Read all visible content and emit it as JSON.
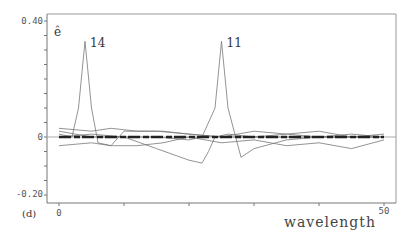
{
  "chart_data": {
    "type": "line",
    "panel_label": "(d)",
    "title": "",
    "xlabel": "wavelength",
    "ylabel": "ê",
    "xlim": [
      0,
      50
    ],
    "ylim": [
      -0.2,
      0.4
    ],
    "x_ticks": [
      "0",
      "50"
    ],
    "y_ticks": [
      "0.40",
      "0",
      "-0.20"
    ],
    "annotations": [
      {
        "text": "14",
        "x": 4,
        "y": 0.33
      },
      {
        "text": "11",
        "x": 25,
        "y": 0.33
      }
    ],
    "grid": false,
    "legend": "none",
    "series": [
      {
        "name": "14",
        "x": [
          0,
          2,
          3,
          4,
          5,
          6,
          8,
          10,
          15,
          20,
          25,
          30,
          35,
          40,
          45,
          50
        ],
        "values": [
          0.01,
          0.0,
          0.1,
          0.33,
          0.1,
          -0.02,
          -0.03,
          0.02,
          0.02,
          0.01,
          0.0,
          0.0,
          0.01,
          0.0,
          0.01,
          0.0
        ]
      },
      {
        "name": "11",
        "x": [
          0,
          5,
          10,
          15,
          20,
          22,
          24,
          25,
          26,
          28,
          30,
          35,
          40,
          45,
          50
        ],
        "values": [
          0.0,
          0.01,
          0.0,
          0.0,
          -0.01,
          0.0,
          0.1,
          0.33,
          0.1,
          -0.07,
          -0.04,
          -0.01,
          0.0,
          0.0,
          0.0
        ]
      },
      {
        "name": "dip",
        "x": [
          0,
          5,
          10,
          15,
          20,
          22,
          23,
          24,
          26,
          30,
          35,
          40,
          45,
          50
        ],
        "values": [
          0.02,
          0.0,
          0.0,
          -0.04,
          -0.08,
          -0.09,
          -0.05,
          0.0,
          0.01,
          0.0,
          0.0,
          0.0,
          0.0,
          0.0
        ]
      },
      {
        "name": "band-upper",
        "x": [
          0,
          5,
          8,
          12,
          16,
          20,
          25,
          30,
          35,
          40,
          45,
          50
        ],
        "values": [
          0.03,
          0.02,
          0.03,
          0.02,
          0.02,
          0.01,
          0.0,
          0.02,
          0.01,
          0.02,
          0.0,
          0.01
        ]
      },
      {
        "name": "band-lower",
        "x": [
          0,
          5,
          8,
          12,
          16,
          20,
          25,
          30,
          35,
          40,
          45,
          50
        ],
        "values": [
          -0.03,
          -0.02,
          -0.03,
          -0.03,
          -0.02,
          0.0,
          -0.02,
          -0.01,
          -0.03,
          -0.02,
          -0.04,
          -0.01
        ]
      }
    ]
  }
}
